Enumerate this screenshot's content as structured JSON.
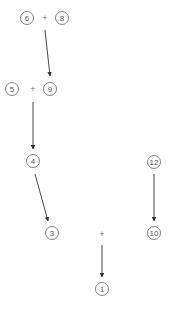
{
  "diagram": {
    "nodes": [
      {
        "id": "n6",
        "label": "6",
        "x": 27,
        "y": 18
      },
      {
        "id": "n8",
        "label": "8",
        "x": 62,
        "y": 18
      },
      {
        "id": "n5",
        "label": "5",
        "x": 12,
        "y": 89
      },
      {
        "id": "n9",
        "label": "9",
        "x": 50,
        "y": 89
      },
      {
        "id": "n4",
        "label": "4",
        "x": 33,
        "y": 161
      },
      {
        "id": "n12",
        "label": "12",
        "x": 154,
        "y": 162
      },
      {
        "id": "n3",
        "label": "3",
        "x": 52,
        "y": 233
      },
      {
        "id": "n10",
        "label": "10",
        "x": 154,
        "y": 233
      },
      {
        "id": "n1",
        "label": "1",
        "x": 102,
        "y": 289
      }
    ],
    "operators": [
      {
        "label": "+",
        "x": 45,
        "y": 18
      },
      {
        "label": "+",
        "x": 33,
        "y": 89
      },
      {
        "label": "+",
        "x": 102,
        "y": 234
      }
    ],
    "edges": [
      {
        "from": "6 + 8",
        "to": "9",
        "x1": 45,
        "y1": 30,
        "x2": 50,
        "y2": 76
      },
      {
        "from": "5 + 9",
        "to": "4",
        "x1": 33,
        "y1": 102,
        "x2": 33,
        "y2": 149
      },
      {
        "from": "4",
        "to": "3",
        "x1": 35,
        "y1": 174,
        "x2": 48,
        "y2": 221
      },
      {
        "from": "12",
        "to": "10",
        "x1": 154,
        "y1": 174,
        "x2": 154,
        "y2": 221
      },
      {
        "from": "+",
        "to": "1",
        "x1": 102,
        "y1": 245,
        "x2": 102,
        "y2": 277
      }
    ]
  }
}
